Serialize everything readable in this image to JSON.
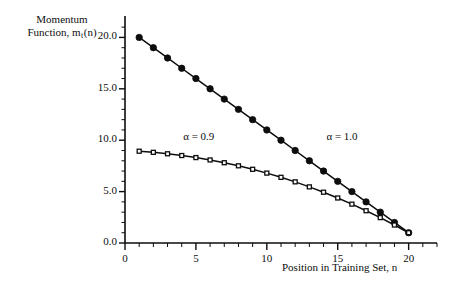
{
  "figure": {
    "background": "#ffffff",
    "ink": "#0d0d0d"
  },
  "labels": {
    "ylabel_line1": "Momentum",
    "ylabel_line2_pre": "Function, m",
    "ylabel_line2_sub": "t",
    "ylabel_line2_post": "(n)",
    "xlabel": "Position in Training Set, n"
  },
  "chart_data": {
    "type": "line",
    "title": "",
    "xlabel": "Position in Training Set, n",
    "ylabel": "Momentum Function, m_t(n)",
    "xlim": [
      0,
      22
    ],
    "ylim": [
      0,
      21.5
    ],
    "grid": false,
    "legend": "inline-annotations",
    "xticks": [
      0,
      5,
      10,
      15,
      20
    ],
    "xtick_labels": [
      "0",
      "5",
      "10",
      "15",
      "20"
    ],
    "xminor_step": 1,
    "yticks": [
      0.0,
      5.0,
      10.0,
      15.0,
      20.0
    ],
    "ytick_labels": [
      "0.0",
      "5.0",
      "10.0",
      "15.0",
      "20.0"
    ],
    "yminor_step": 1,
    "x": [
      1,
      2,
      3,
      4,
      5,
      6,
      7,
      8,
      9,
      10,
      11,
      12,
      13,
      14,
      15,
      16,
      17,
      18,
      19,
      20
    ],
    "series": [
      {
        "name": "alpha = 1.0",
        "annotation": "α = 1.0",
        "annotation_x": 14.2,
        "annotation_y": 10.3,
        "marker": "filled-circle",
        "marker_size": 3.2,
        "color": "#0d0d0d",
        "values": [
          20.0,
          19.0,
          18.0,
          17.0,
          16.0,
          15.0,
          14.0,
          13.0,
          12.0,
          11.0,
          10.0,
          9.0,
          8.0,
          7.0,
          6.0,
          5.0,
          4.0,
          3.0,
          2.0,
          1.0
        ]
      },
      {
        "name": "alpha = 0.9",
        "annotation": "α = 0.9",
        "annotation_x": 4.1,
        "annotation_y": 10.3,
        "marker": "open-square",
        "marker_size": 4.0,
        "color": "#0d0d0d",
        "values": [
          8.93,
          8.82,
          8.68,
          8.51,
          8.31,
          8.08,
          7.81,
          7.51,
          7.17,
          6.8,
          6.39,
          5.95,
          5.46,
          4.94,
          4.38,
          3.78,
          3.14,
          2.47,
          1.75,
          1.0
        ]
      }
    ]
  }
}
